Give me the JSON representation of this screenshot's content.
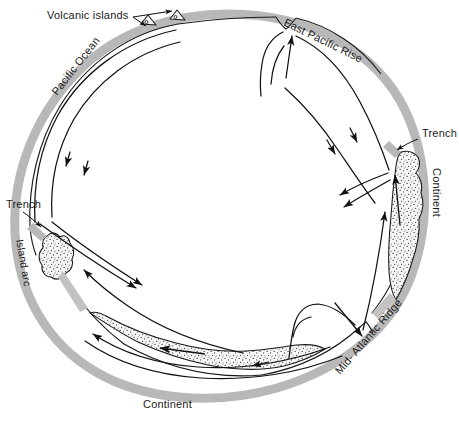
{
  "diagram": {
    "type": "earth-cross-section-ring",
    "background_color": "#ffffff",
    "ocean_band_color": "#b8b8b8",
    "crust_outline_color": "#1a1a1a",
    "continent_fill": "#f2f2f2",
    "continent_stipple_color": "#3a3a3a",
    "flow_line_color": "#111111",
    "labels": {
      "volcanic_islands": "Volcanic islands",
      "east_pacific_rise": "East Pacific Rise",
      "pacific_ocean": "Pacific Ocean",
      "trench_left": "Trench",
      "trench_right": "Trench",
      "island_arc": "Island arc",
      "continent_right": "Continent",
      "continent_bottom": "Continent",
      "mid_atlantic_ridge": "Mid- Atlantic Ridge"
    },
    "features": [
      {
        "name": "volcanic-islands",
        "label": "Volcanic islands",
        "kind": "annotation",
        "count": 2
      },
      {
        "name": "east-pacific-rise",
        "label": "East Pacific Rise",
        "kind": "spreading-ridge"
      },
      {
        "name": "mid-atlantic-ridge",
        "label": "Mid- Atlantic Ridge",
        "kind": "spreading-ridge"
      },
      {
        "name": "trench-left",
        "label": "Trench",
        "kind": "subduction-trench"
      },
      {
        "name": "trench-right",
        "label": "Trench",
        "kind": "subduction-trench"
      },
      {
        "name": "island-arc",
        "label": "Island arc",
        "kind": "landmass"
      },
      {
        "name": "continent-right",
        "label": "Continent",
        "kind": "landmass"
      },
      {
        "name": "continent-bottom",
        "label": "Continent",
        "kind": "landmass"
      },
      {
        "name": "pacific-ocean",
        "label": "Pacific Ocean",
        "kind": "ocean-basin"
      }
    ]
  }
}
